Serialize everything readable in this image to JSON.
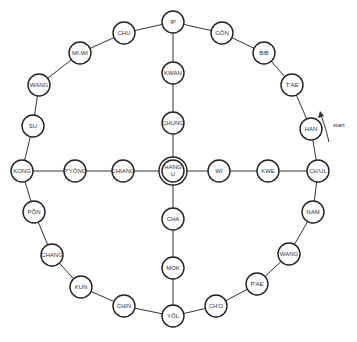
{
  "diagram": {
    "start_label": "start",
    "center": {
      "id": "hangu",
      "line1": "HANG",
      "line2": "U",
      "x": 173,
      "y": 171
    },
    "nodes": [
      {
        "id": "ip",
        "label": "IP",
        "x": 173,
        "y": 22
      },
      {
        "id": "gon",
        "label": "GŎN",
        "x": 222,
        "y": 33
      },
      {
        "id": "bib",
        "label": "BIB",
        "x": 264,
        "y": 53
      },
      {
        "id": "tae",
        "label": "T'AE",
        "x": 292,
        "y": 85
      },
      {
        "id": "han",
        "label": "HAN",
        "x": 311,
        "y": 129
      },
      {
        "id": "chul",
        "label": "CH'UL",
        "x": 318,
        "y": 171
      },
      {
        "id": "nam",
        "label": "NAM",
        "x": 313,
        "y": 212
      },
      {
        "id": "wang_r",
        "label": "WANG",
        "x": 289,
        "y": 254
      },
      {
        "id": "pae",
        "label": "P'AE",
        "x": 257,
        "y": 284
      },
      {
        "id": "cho",
        "label": "CH'O",
        "x": 216,
        "y": 306
      },
      {
        "id": "yol",
        "label": "YŎL",
        "x": 173,
        "y": 316
      },
      {
        "id": "chin",
        "label": "CHIN",
        "x": 124,
        "y": 306
      },
      {
        "id": "kun",
        "label": "KUN",
        "x": 81,
        "y": 287
      },
      {
        "id": "chang_l",
        "label": "CHANG",
        "x": 52,
        "y": 255
      },
      {
        "id": "pon",
        "label": "PŎN",
        "x": 34,
        "y": 212
      },
      {
        "id": "kong",
        "label": "KONG",
        "x": 22,
        "y": 171
      },
      {
        "id": "su",
        "label": "SU",
        "x": 33,
        "y": 126
      },
      {
        "id": "wang_l",
        "label": "WANG",
        "x": 39,
        "y": 85
      },
      {
        "id": "miwi",
        "label": "MI-WI",
        "x": 80,
        "y": 53
      },
      {
        "id": "chu",
        "label": "CHU",
        "x": 124,
        "y": 33
      },
      {
        "id": "kwan",
        "label": "KWAN",
        "x": 173,
        "y": 73
      },
      {
        "id": "chung",
        "label": "CHUNG",
        "x": 173,
        "y": 123
      },
      {
        "id": "cha",
        "label": "CHA",
        "x": 173,
        "y": 219
      },
      {
        "id": "mok",
        "label": "MOK",
        "x": 173,
        "y": 268
      },
      {
        "id": "pyong",
        "label": "P'YŎNG",
        "x": 75,
        "y": 171
      },
      {
        "id": "chiang",
        "label": "CHIANG",
        "x": 123,
        "y": 171
      },
      {
        "id": "wi",
        "label": "WI",
        "x": 219,
        "y": 171
      },
      {
        "id": "kwe",
        "label": "KWE",
        "x": 268,
        "y": 171
      }
    ]
  }
}
